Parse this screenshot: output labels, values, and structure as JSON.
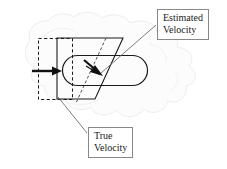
{
  "figure": {
    "type": "technical-diagram",
    "title": "",
    "background_shape": "irregular-cloud-blob",
    "annotations": [
      {
        "id": "estimated-velocity",
        "line1": "Estimated",
        "line2": "Velocity",
        "box": {
          "x": 157,
          "y": 9,
          "w": 62,
          "h": 31
        },
        "leader_from": {
          "x": 157,
          "y": 26
        },
        "leader_to": {
          "x": 100,
          "y": 72
        },
        "arrow_direction": "down-right-diagonal"
      },
      {
        "id": "true-velocity",
        "line1": "True",
        "line2": "Velocity",
        "box": {
          "x": 88,
          "y": 127,
          "w": 52,
          "h": 31
        },
        "leader_from": {
          "x": 88,
          "y": 133
        },
        "leader_to": {
          "x": 60,
          "y": 98
        },
        "arrow_direction": "right-horizontal"
      }
    ],
    "shapes": {
      "dashed_rect": {
        "x": 38,
        "y": 38,
        "w": 34,
        "h": 62,
        "style": "dashed",
        "color": "#1a1a1a"
      },
      "parallelogram": {
        "points": "57,38 123,38 95,98 57,98",
        "style": "solid",
        "color": "#1a1a1a"
      },
      "stadium": {
        "x": 62,
        "y": 55,
        "w": 86,
        "h": 31,
        "radius": 15,
        "style": "solid",
        "color": "#1a1a1a"
      },
      "dashed_diagonal": {
        "x1": 105,
        "y1": 38,
        "x2": 75,
        "y2": 103,
        "style": "dashed",
        "color": "#555555"
      }
    },
    "arrows": {
      "true_velocity_arrow": {
        "x1": 33,
        "y1": 71,
        "x2": 60,
        "y2": 71,
        "label": "true-velocity"
      },
      "estimated_velocity_arrow": {
        "x1": 85,
        "y1": 60,
        "x2": 102,
        "y2": 75,
        "label": "estimated-velocity"
      }
    },
    "colors": {
      "ink": "#1a1a1a",
      "leader": "#7a7a7a",
      "box_border": "#888888",
      "blob_fill": "#fbfbfb",
      "blob_stroke": "#e8e8e8",
      "background": "#ffffff"
    }
  }
}
